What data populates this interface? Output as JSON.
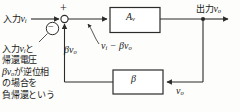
{
  "diagram": {
    "type": "feedback-block-diagram",
    "title_text": "negative feedback amplifier block diagram",
    "stroke_color": "#2b2b2b",
    "background_color": "#fdfdfb",
    "labels": {
      "input": {
        "text": "入力",
        "var": "v",
        "sub": "i"
      },
      "output": {
        "text": "出力",
        "var": "v",
        "sub": "o"
      },
      "plus_sign": "+",
      "minus_sign": "−",
      "amplifier_block": {
        "var": "A",
        "sub": "v"
      },
      "feedback_block": {
        "var": "β"
      },
      "feedback_voltage": {
        "var": "βv",
        "sub": "o"
      },
      "difference_signal": {
        "left": "v",
        "left_sub": "i",
        "op": "−",
        "right": "βv",
        "right_sub": "o"
      },
      "output_sense": {
        "var": "v",
        "sub": "o"
      }
    },
    "note": {
      "lines": [
        {
          "jp_a": "入力",
          "var": "v",
          "sub": "i",
          "jp_b": "と"
        },
        {
          "jp_a": "帰還電圧",
          "var": "",
          "sub": "",
          "jp_b": ""
        },
        {
          "jp_a": "",
          "var": "βv",
          "sub": "o",
          "jp_b": "が逆位相"
        },
        {
          "jp_a": "の場合を",
          "var": "",
          "sub": "",
          "jp_b": ""
        },
        {
          "jp_a": "負帰還という",
          "var": "",
          "sub": "",
          "jp_b": ""
        }
      ],
      "plain_text": "入力viと帰還電圧βvoが逆位相の場合を負帰還という"
    }
  }
}
